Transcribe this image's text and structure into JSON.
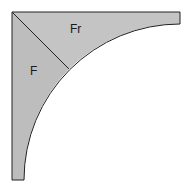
{
  "diagram": {
    "regions": [
      {
        "id": "F",
        "label": "F"
      },
      {
        "id": "Fr",
        "label": "Fr"
      }
    ],
    "colors": {
      "fill": "#bdbdbd",
      "stroke": "#222222",
      "background": "#ffffff"
    }
  }
}
